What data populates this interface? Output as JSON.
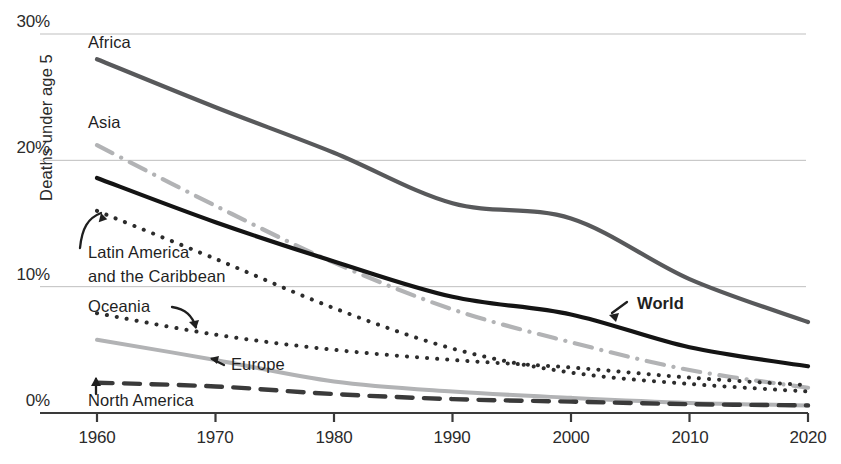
{
  "chart_data": {
    "type": "line",
    "title": "",
    "xlabel": "",
    "ylabel": "Deaths under age 5",
    "xlim": [
      1960,
      2020
    ],
    "ylim": [
      0,
      30
    ],
    "yticks": [
      "0%",
      "10%",
      "20%",
      "30%"
    ],
    "ytick_values": [
      0,
      10,
      20,
      30
    ],
    "xticks": [
      "1960",
      "1970",
      "1980",
      "1990",
      "2000",
      "2010",
      "2020"
    ],
    "xtick_values": [
      1960,
      1970,
      1980,
      1990,
      2000,
      2010,
      2020
    ],
    "grid": "horizontal",
    "legend": "inline-annotations",
    "x": [
      1960,
      1970,
      1980,
      1990,
      2000,
      2010,
      2020
    ],
    "series": [
      {
        "name": "Africa",
        "style": "solid",
        "color": "#58595b",
        "width": 4.2,
        "values": [
          28.0,
          24.2,
          20.6,
          16.6,
          15.4,
          10.6,
          7.2
        ]
      },
      {
        "name": "Asia",
        "style": "dash-dot",
        "color": "#b2b3b5",
        "width": 4.2,
        "values": [
          21.2,
          16.4,
          11.9,
          8.2,
          5.6,
          3.4,
          2.0
        ]
      },
      {
        "name": "World",
        "style": "solid",
        "color": "#141414",
        "width": 4.2,
        "values": [
          18.6,
          15.1,
          12.0,
          9.2,
          7.8,
          5.2,
          3.7
        ]
      },
      {
        "name": "Latin America and the Caribbean",
        "style": "dotted",
        "color": "#2c2c2c",
        "width": 4.0,
        "values": [
          16.0,
          12.2,
          8.3,
          5.1,
          3.2,
          2.3,
          1.7
        ]
      },
      {
        "name": "Oceania",
        "style": "dotted",
        "color": "#2c2c2c",
        "width": 4.0,
        "values": [
          7.9,
          6.2,
          5.0,
          4.2,
          3.6,
          2.8,
          2.2
        ]
      },
      {
        "name": "Europe",
        "style": "solid",
        "color": "#b2b3b5",
        "width": 4.0,
        "values": [
          5.8,
          4.2,
          2.5,
          1.7,
          1.2,
          0.8,
          0.6
        ]
      },
      {
        "name": "North America",
        "style": "dashed",
        "color": "#3a3a3a",
        "width": 4.4,
        "values": [
          2.4,
          2.1,
          1.5,
          1.1,
          0.9,
          0.7,
          0.6
        ]
      }
    ],
    "annotations": [
      {
        "key": "africa",
        "text": "Africa"
      },
      {
        "key": "asia",
        "text": "Asia"
      },
      {
        "key": "world",
        "text": "World"
      },
      {
        "key": "latam_1",
        "text": "Latin America"
      },
      {
        "key": "latam_2",
        "text": "and the Caribbean"
      },
      {
        "key": "oceania",
        "text": "Oceania"
      },
      {
        "key": "europe",
        "text": "Europe"
      },
      {
        "key": "namerica",
        "text": "North America"
      }
    ]
  },
  "axis_color": "#3a3a3a",
  "grid_color": "#bfbfbf"
}
